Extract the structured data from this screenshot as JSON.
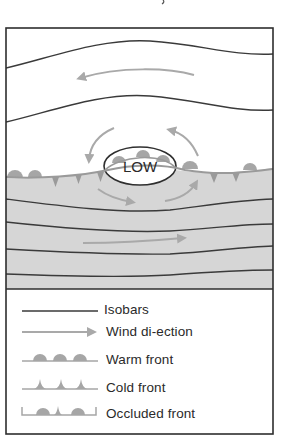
{
  "figure": {
    "type": "weather-map-diagram",
    "center_label": "LOW",
    "colors": {
      "isobar": "#3a3a3a",
      "wind_arrow": "#a9a9a9",
      "front_symbol": "#a6a6a6",
      "shaded_airmass": "#d6d6d6",
      "background": "#ffffff",
      "frame": "#2e2e2e"
    }
  },
  "legend": {
    "items": [
      {
        "symbol": "isobar-line",
        "label": "Isobars"
      },
      {
        "symbol": "wind-arrow",
        "label": "Wind di-ection"
      },
      {
        "symbol": "warm-front",
        "label": "Warm front"
      },
      {
        "symbol": "cold-front",
        "label": "Cold front"
      },
      {
        "symbol": "occluded-front",
        "label": "Occluded front"
      }
    ]
  }
}
